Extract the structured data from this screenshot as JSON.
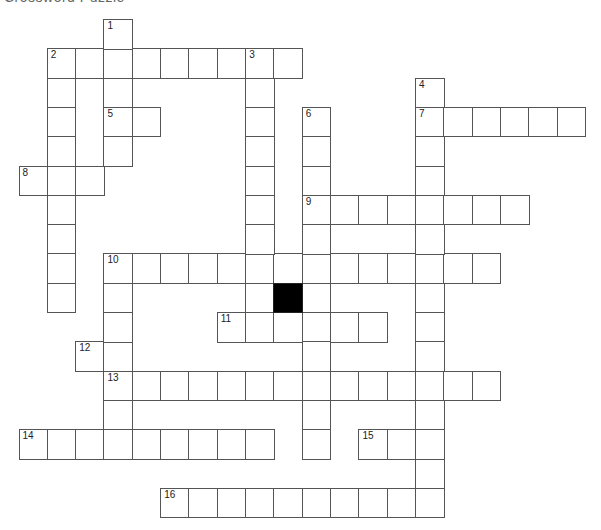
{
  "title": "Crossword Puzzle",
  "grid": {
    "origin_x": 18.5,
    "origin_y": 19,
    "cell_w": 28.33,
    "cell_h": 29.3,
    "border_color": "#555555",
    "block_color": "#000000"
  },
  "clue_numbers": [
    {
      "num": "1",
      "row": 0,
      "col": 3
    },
    {
      "num": "2",
      "row": 1,
      "col": 1
    },
    {
      "num": "3",
      "row": 1,
      "col": 8
    },
    {
      "num": "4",
      "row": 2,
      "col": 14
    },
    {
      "num": "5",
      "row": 3,
      "col": 3
    },
    {
      "num": "6",
      "row": 3,
      "col": 10
    },
    {
      "num": "7",
      "row": 3,
      "col": 14
    },
    {
      "num": "8",
      "row": 5,
      "col": 0
    },
    {
      "num": "9",
      "row": 6,
      "col": 10
    },
    {
      "num": "10",
      "row": 8,
      "col": 3
    },
    {
      "num": "11",
      "row": 10,
      "col": 7
    },
    {
      "num": "12",
      "row": 11,
      "col": 2
    },
    {
      "num": "13",
      "row": 12,
      "col": 3
    },
    {
      "num": "14",
      "row": 14,
      "col": 0
    },
    {
      "num": "15",
      "row": 14,
      "col": 12
    },
    {
      "num": "16",
      "row": 16,
      "col": 5
    }
  ],
  "words": {
    "across": [
      {
        "num": "2",
        "row": 1,
        "col": 1,
        "length": 9
      },
      {
        "num": "5",
        "row": 3,
        "col": 3,
        "length": 2
      },
      {
        "num": "7",
        "row": 3,
        "col": 14,
        "length": 6
      },
      {
        "num": "8",
        "row": 5,
        "col": 0,
        "length": 3
      },
      {
        "num": "9",
        "row": 6,
        "col": 10,
        "length": 8
      },
      {
        "num": "10",
        "row": 8,
        "col": 3,
        "length": 14
      },
      {
        "num": "11",
        "row": 10,
        "col": 7,
        "length": 6
      },
      {
        "num": "12",
        "row": 11,
        "col": 2,
        "length": 2
      },
      {
        "num": "13",
        "row": 12,
        "col": 3,
        "length": 14
      },
      {
        "num": "14",
        "row": 14,
        "col": 0,
        "length": 9
      },
      {
        "num": "15",
        "row": 14,
        "col": 12,
        "length": 3
      },
      {
        "num": "16",
        "row": 16,
        "col": 5,
        "length": 10
      }
    ],
    "down": [
      {
        "num": "1",
        "row": 0,
        "col": 3,
        "length": 5
      },
      {
        "num": "2",
        "row": 1,
        "col": 1,
        "length": 9
      },
      {
        "num": "3",
        "row": 1,
        "col": 8,
        "length": 10
      },
      {
        "num": "4",
        "row": 2,
        "col": 14,
        "length": 15
      },
      {
        "num": "6",
        "row": 3,
        "col": 10,
        "length": 12
      },
      {
        "num": "10",
        "row": 8,
        "col": 3,
        "length": 7
      }
    ]
  },
  "blocks": [
    {
      "row": 9,
      "col": 9
    }
  ]
}
